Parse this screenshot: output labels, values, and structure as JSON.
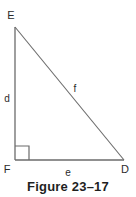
{
  "figure": {
    "caption": "Figure 23–17",
    "background_color": "#ffffff",
    "stroke_color": "#6b6b6b",
    "label_color": "#2b2b2b",
    "vertices": [
      {
        "name": "E",
        "label": "E",
        "x": 15,
        "y": 27,
        "label_x": 11,
        "label_y": 19
      },
      {
        "name": "F",
        "label": "F",
        "x": 15,
        "y": 160,
        "label_x": 4,
        "label_y": 173
      },
      {
        "name": "D",
        "label": "D",
        "x": 124,
        "y": 160,
        "label_x": 122,
        "label_y": 173
      }
    ],
    "sides": [
      {
        "name": "d",
        "label": "d",
        "from": "E",
        "to": "F",
        "label_x": 6,
        "label_y": 99
      },
      {
        "name": "f",
        "label": "f",
        "from": "E",
        "to": "D",
        "label_x": 74,
        "label_y": 92
      },
      {
        "name": "e",
        "label": "e",
        "from": "F",
        "to": "D",
        "label_x": 66,
        "label_y": 175
      }
    ],
    "right_angle": {
      "at": "F",
      "size": 14
    }
  }
}
